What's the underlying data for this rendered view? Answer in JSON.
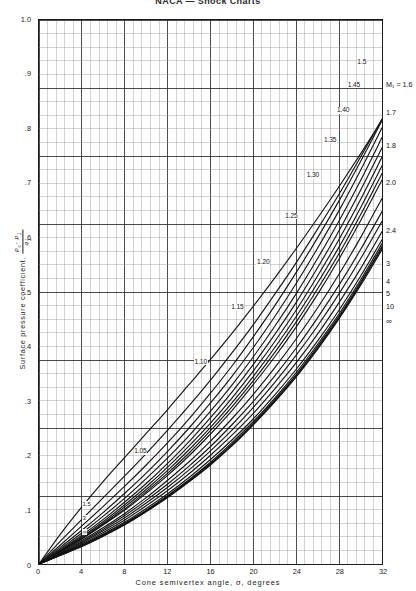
{
  "page": {
    "title": "NACA — Shock Charts"
  },
  "axes": {
    "y_title_text": "Surface  pressure  coefficient,",
    "y_fraction_numerator": "p_c - p_1",
    "y_fraction_denominator": "q_1",
    "y_numerator_main": "p",
    "y_numerator_sub1": "c",
    "y_numerator_minus": "- p",
    "y_numerator_sub2": "1",
    "y_denominator_main": "q",
    "y_denominator_sub": "1",
    "x_title": "Cone  semivertex  angle,  σ,  degrees",
    "y_ticks": [
      "1.0",
      ".9",
      ".8",
      ".7",
      ".6",
      ".5",
      ".4",
      ".3",
      ".2",
      ".1",
      "0"
    ],
    "y_tick_values": [
      1.0,
      0.9,
      0.8,
      0.7,
      0.6,
      0.5,
      0.4,
      0.3,
      0.2,
      0.1,
      0.0
    ],
    "x_ticks": [
      "0",
      "4",
      "8",
      "12",
      "16",
      "20",
      "24",
      "28",
      "32"
    ],
    "x_tick_values": [
      0,
      4,
      8,
      12,
      16,
      20,
      24,
      28,
      32
    ]
  },
  "grid": {
    "minor_color": "#9a9a9a",
    "major_color": "#2b2b2b",
    "minor_step_x": 0.8,
    "minor_step_y": 0.025,
    "major_every": 5
  },
  "chart_data": {
    "type": "line",
    "title": "NACA — Shock Charts",
    "xlabel": "Cone semivertex angle, σ, degrees",
    "ylabel": "Surface pressure coefficient, (p_c - p_1)/q_1",
    "xlim": [
      0,
      32
    ],
    "ylim": [
      0,
      1.0
    ],
    "grid": true,
    "legend": "inline-curve-labels",
    "x": [
      0,
      2,
      4,
      6,
      8,
      10,
      12,
      14,
      16,
      18,
      20,
      22,
      24,
      26,
      28,
      30,
      32
    ],
    "series": [
      {
        "name": "1.05",
        "label": "1.05",
        "label_pos": {
          "x": 9.6,
          "y": 0.208
        },
        "values": [
          0.0,
          0.055,
          0.105,
          0.152,
          0.196,
          0.24,
          0.284,
          0.33,
          0.376,
          0.424,
          0.474,
          0.526,
          0.58,
          0.636,
          0.694,
          0.754,
          0.816
        ]
      },
      {
        "name": "1.10",
        "label": "1.10",
        "label_pos": {
          "x": 15.2,
          "y": 0.372
        },
        "values": [
          0.0,
          0.042,
          0.082,
          0.122,
          0.162,
          0.203,
          0.246,
          0.291,
          0.338,
          0.388,
          0.44,
          0.496,
          0.554,
          0.616,
          0.68,
          0.748,
          0.818
        ]
      },
      {
        "name": "1.15",
        "label": "1.15",
        "label_pos": {
          "x": 18.6,
          "y": 0.472
        },
        "values": [
          0.0,
          0.035,
          0.07,
          0.106,
          0.143,
          0.182,
          0.223,
          0.267,
          0.314,
          0.364,
          0.418,
          0.475,
          0.536,
          0.6,
          0.668,
          0.74,
          0.815
        ]
      },
      {
        "name": "1.20",
        "label": "1.20",
        "label_pos": {
          "x": 21.0,
          "y": 0.555
        },
        "values": [
          0.0,
          0.031,
          0.062,
          0.095,
          0.13,
          0.167,
          0.207,
          0.25,
          0.296,
          0.345,
          0.398,
          0.455,
          0.516,
          0.581,
          0.65,
          0.724,
          0.802
        ]
      },
      {
        "name": "1.25",
        "label": "1.25",
        "label_pos": {
          "x": 23.6,
          "y": 0.64
        },
        "values": [
          0.0,
          0.028,
          0.057,
          0.088,
          0.121,
          0.157,
          0.195,
          0.236,
          0.281,
          0.329,
          0.381,
          0.437,
          0.497,
          0.562,
          0.631,
          0.705,
          0.784
        ]
      },
      {
        "name": "1.30",
        "label": "1.30",
        "label_pos": {
          "x": 25.6,
          "y": 0.714
        },
        "values": [
          0.0,
          0.026,
          0.053,
          0.082,
          0.114,
          0.148,
          0.185,
          0.225,
          0.269,
          0.316,
          0.367,
          0.422,
          0.481,
          0.545,
          0.613,
          0.687,
          0.765
        ]
      },
      {
        "name": "1.35",
        "label": "1.35",
        "label_pos": {
          "x": 27.2,
          "y": 0.779
        },
        "values": [
          0.0,
          0.025,
          0.05,
          0.078,
          0.109,
          0.142,
          0.178,
          0.217,
          0.259,
          0.305,
          0.355,
          0.409,
          0.467,
          0.53,
          0.597,
          0.67,
          0.748
        ]
      },
      {
        "name": "1.40",
        "label": "1.40",
        "label_pos": {
          "x": 28.4,
          "y": 0.833
        },
        "values": [
          0.0,
          0.024,
          0.048,
          0.075,
          0.105,
          0.137,
          0.172,
          0.21,
          0.251,
          0.296,
          0.345,
          0.398,
          0.455,
          0.517,
          0.583,
          0.655,
          0.732
        ]
      },
      {
        "name": "1.45",
        "label": "1.45",
        "label_pos": {
          "x": 29.4,
          "y": 0.88
        },
        "values": [
          0.0,
          0.023,
          0.047,
          0.073,
          0.101,
          0.133,
          0.167,
          0.204,
          0.245,
          0.289,
          0.337,
          0.389,
          0.445,
          0.506,
          0.571,
          0.642,
          0.718
        ]
      },
      {
        "name": "1.5",
        "label": "1.5",
        "label_pos": {
          "x": 30.2,
          "y": 0.92
        },
        "values": [
          0.0,
          0.023,
          0.046,
          0.072,
          0.099,
          0.13,
          0.163,
          0.199,
          0.239,
          0.282,
          0.33,
          0.381,
          0.436,
          0.496,
          0.561,
          0.631,
          0.706
        ]
      },
      {
        "name": "1.6",
        "label": "1.7",
        "label_pos": {
          "x": 32.0,
          "y": 0.83
        },
        "values": [
          0.0,
          0.021,
          0.043,
          0.067,
          0.093,
          0.122,
          0.154,
          0.188,
          0.226,
          0.267,
          0.312,
          0.361,
          0.414,
          0.471,
          0.533,
          0.6,
          0.672
        ]
      },
      {
        "name": "1.7",
        "label": "1.8",
        "label_pos": {
          "x": 32.0,
          "y": 0.77
        },
        "values": [
          0.0,
          0.02,
          0.041,
          0.064,
          0.089,
          0.117,
          0.147,
          0.18,
          0.216,
          0.256,
          0.299,
          0.346,
          0.397,
          0.453,
          0.513,
          0.578,
          0.648
        ]
      },
      {
        "name": "1.8",
        "label": "2.0",
        "label_pos": {
          "x": 32.0,
          "y": 0.7
        },
        "values": [
          0.0,
          0.019,
          0.039,
          0.061,
          0.085,
          0.112,
          0.141,
          0.173,
          0.208,
          0.246,
          0.288,
          0.334,
          0.384,
          0.438,
          0.497,
          0.561,
          0.63
        ]
      },
      {
        "name": "2.0",
        "label": "2.4",
        "label_pos": {
          "x": 32.0,
          "y": 0.612
        },
        "values": [
          0.0,
          0.018,
          0.037,
          0.058,
          0.081,
          0.107,
          0.135,
          0.166,
          0.2,
          0.237,
          0.277,
          0.322,
          0.37,
          0.423,
          0.481,
          0.543,
          0.611
        ]
      },
      {
        "name": "2.4",
        "label": "3",
        "label_pos": {
          "x": 32.0,
          "y": 0.552
        },
        "values": [
          0.0,
          0.017,
          0.035,
          0.055,
          0.077,
          0.102,
          0.129,
          0.159,
          0.192,
          0.228,
          0.267,
          0.311,
          0.358,
          0.41,
          0.467,
          0.529,
          0.596
        ]
      },
      {
        "name": "3",
        "label": "4",
        "label_pos": {
          "x": 32.0,
          "y": 0.52
        },
        "values": [
          0.0,
          0.017,
          0.034,
          0.054,
          0.075,
          0.099,
          0.126,
          0.155,
          0.187,
          0.223,
          0.262,
          0.305,
          0.352,
          0.404,
          0.46,
          0.522,
          0.589
        ]
      },
      {
        "name": "4",
        "label": "5",
        "label_pos": {
          "x": 32.0,
          "y": 0.497
        },
        "values": [
          0.0,
          0.016,
          0.033,
          0.053,
          0.074,
          0.098,
          0.124,
          0.153,
          0.185,
          0.22,
          0.259,
          0.302,
          0.348,
          0.4,
          0.456,
          0.518,
          0.584
        ]
      },
      {
        "name": "5",
        "label": "10",
        "label_pos": {
          "x": 32.0,
          "y": 0.474
        },
        "values": [
          0.0,
          0.016,
          0.033,
          0.052,
          0.073,
          0.097,
          0.123,
          0.152,
          0.184,
          0.219,
          0.257,
          0.3,
          0.346,
          0.397,
          0.453,
          0.515,
          0.581
        ]
      },
      {
        "name": "10",
        "label": "∞",
        "label_pos": {
          "x": 32.0,
          "y": 0.448
        },
        "values": [
          0.0,
          0.016,
          0.032,
          0.051,
          0.072,
          0.096,
          0.122,
          0.151,
          0.182,
          0.217,
          0.256,
          0.298,
          0.344,
          0.395,
          0.451,
          0.512,
          0.578
        ]
      }
    ],
    "mach_label_text": "M₁ = 1.6",
    "mach_label_pos": {
      "x": 32.0,
      "y": 0.88
    }
  },
  "curve_labels_inline": [
    {
      "text": "1.05",
      "x": 9.6,
      "y": 0.208
    },
    {
      "text": "1.10",
      "x": 15.2,
      "y": 0.372
    },
    {
      "text": "1.15",
      "x": 18.6,
      "y": 0.472
    },
    {
      "text": "1.20",
      "x": 21.0,
      "y": 0.555
    },
    {
      "text": "1.25",
      "x": 23.6,
      "y": 0.64
    },
    {
      "text": "1.30",
      "x": 25.6,
      "y": 0.714
    },
    {
      "text": "1.35",
      "x": 27.2,
      "y": 0.779
    },
    {
      "text": "1.40",
      "x": 28.4,
      "y": 0.833
    },
    {
      "text": "1.45",
      "x": 29.4,
      "y": 0.88
    },
    {
      "text": "1.5",
      "x": 30.3,
      "y": 0.922
    }
  ],
  "curve_labels_right": [
    {
      "text": "M₁ = 1.6",
      "y": 0.88,
      "mach": true
    },
    {
      "text": "1.7",
      "y": 0.828
    },
    {
      "text": "1.8",
      "y": 0.768
    },
    {
      "text": "2.0",
      "y": 0.699
    },
    {
      "text": "2.4",
      "y": 0.611
    },
    {
      "text": "3",
      "y": 0.551
    },
    {
      "text": "4",
      "y": 0.519
    },
    {
      "text": "5",
      "y": 0.496
    },
    {
      "text": "10",
      "y": 0.473
    },
    {
      "text": "∞",
      "y": 0.447
    }
  ],
  "curve_labels_bottomleft": [
    {
      "text": "1.5",
      "x": 4.35,
      "y": 0.112
    },
    {
      "text": "3",
      "x": 4.35,
      "y": 0.086
    },
    {
      "text": "∞",
      "x": 4.35,
      "y": 0.06
    }
  ],
  "style": {
    "curve_color": "#141414",
    "frame_color": "#1d1d1d",
    "text_color": "#1a1a1a",
    "background": "#ffffff"
  }
}
